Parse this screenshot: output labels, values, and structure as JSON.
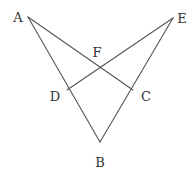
{
  "diagram": {
    "type": "geometry-figure",
    "points": {
      "A": {
        "label": "A",
        "x": 28,
        "y": 17,
        "label_x": 18,
        "label_y": 22
      },
      "E": {
        "label": "E",
        "x": 173,
        "y": 18,
        "label_x": 182,
        "label_y": 23
      },
      "F": {
        "label": "F",
        "x": 100,
        "y": 66,
        "label_x": 97,
        "label_y": 57
      },
      "D": {
        "label": "D",
        "x": 67,
        "y": 90,
        "label_x": 55,
        "label_y": 101
      },
      "C": {
        "label": "C",
        "x": 133,
        "y": 90,
        "label_x": 146,
        "label_y": 101
      },
      "B": {
        "label": "B",
        "x": 100,
        "y": 142,
        "label_x": 100,
        "label_y": 167
      }
    },
    "segments": [
      {
        "from": "A",
        "to": "B",
        "name": "segment-AB"
      },
      {
        "from": "E",
        "to": "B",
        "name": "segment-EB"
      },
      {
        "from": "A",
        "to": "C",
        "name": "segment-AC"
      },
      {
        "from": "E",
        "to": "D",
        "name": "segment-ED"
      }
    ],
    "line_color": "#555555",
    "label_color": "#333333"
  }
}
